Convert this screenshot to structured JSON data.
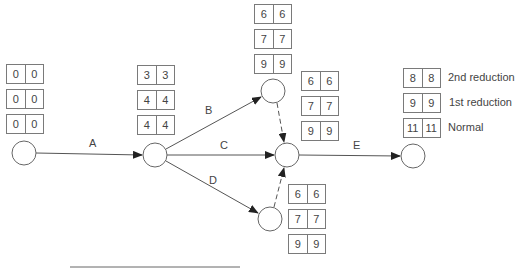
{
  "diagram": {
    "type": "activity-on-arrow network with crashing",
    "nodes": [
      {
        "id": "n1",
        "x": 24,
        "y": 153
      },
      {
        "id": "n2",
        "x": 155,
        "y": 155
      },
      {
        "id": "n3",
        "x": 273,
        "y": 91
      },
      {
        "id": "n4",
        "x": 287,
        "y": 155
      },
      {
        "id": "n5",
        "x": 270,
        "y": 219
      },
      {
        "id": "n6",
        "x": 413,
        "y": 156
      }
    ],
    "activities": [
      {
        "label": "A",
        "from": "n1",
        "to": "n2",
        "dummy": false
      },
      {
        "label": "B",
        "from": "n2",
        "to": "n3",
        "dummy": false
      },
      {
        "label": "C",
        "from": "n2",
        "to": "n4",
        "dummy": false
      },
      {
        "label": "D",
        "from": "n2",
        "to": "n5",
        "dummy": false
      },
      {
        "label": "",
        "from": "n3",
        "to": "n4",
        "dummy": true
      },
      {
        "label": "",
        "from": "n5",
        "to": "n4",
        "dummy": true
      },
      {
        "label": "E",
        "from": "n4",
        "to": "n6",
        "dummy": false
      }
    ],
    "time_boxes": {
      "n1": [
        [
          "0",
          "0"
        ],
        [
          "0",
          "0"
        ],
        [
          "0",
          "0"
        ]
      ],
      "n2": [
        [
          "3",
          "3"
        ],
        [
          "4",
          "4"
        ],
        [
          "4",
          "4"
        ]
      ],
      "n3": [
        [
          "6",
          "6"
        ],
        [
          "7",
          "7"
        ],
        [
          "9",
          "9"
        ]
      ],
      "n4": [
        [
          "6",
          "6"
        ],
        [
          "7",
          "7"
        ],
        [
          "9",
          "9"
        ]
      ],
      "n5": [
        [
          "6",
          "6"
        ],
        [
          "7",
          "7"
        ],
        [
          "9",
          "9"
        ]
      ],
      "n6": [
        [
          "8",
          "8"
        ],
        [
          "9",
          "9"
        ],
        [
          "11",
          "11"
        ]
      ]
    },
    "legend": [
      "2nd reduction",
      "1st reduction",
      "Normal"
    ]
  }
}
